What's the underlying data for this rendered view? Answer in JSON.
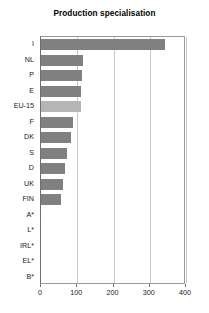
{
  "chart_data": {
    "type": "bar",
    "orientation": "horizontal",
    "title": "Production specialisation",
    "xlabel": "",
    "ylabel": "",
    "xlim": [
      0,
      400
    ],
    "xticks": [
      0,
      100,
      200,
      300,
      400
    ],
    "xtick_labels": [
      "0",
      "100",
      "200",
      "300",
      "400"
    ],
    "grid": true,
    "grid_axis": "x",
    "legend": null,
    "categories": [
      "I",
      "NL",
      "P",
      "E",
      "EU-15",
      "F",
      "DK",
      "S",
      "D",
      "UK",
      "FIN",
      "A*",
      "L*",
      "IRL*",
      "EL*",
      "B*"
    ],
    "values": [
      343,
      115,
      112,
      111,
      110,
      89,
      84,
      72,
      67,
      62,
      56,
      0,
      0,
      0,
      0,
      0
    ],
    "highlight_category": "EU-15",
    "colors": {
      "bar": "#808080",
      "bar_highlight": "#b5b5b5",
      "grid": "#c8c8c8",
      "axis": "#6f6f6f",
      "frame": "#9a9a9a",
      "text": "#222222",
      "background": "#ffffff"
    }
  }
}
